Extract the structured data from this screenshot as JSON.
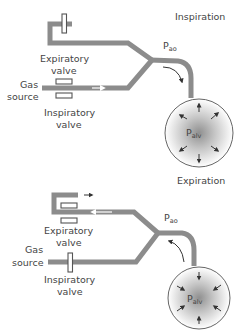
{
  "diagram": {
    "type": "ventilator-circuit-schematic",
    "colors": {
      "tube": "#8c8c8c",
      "valve_outline": "#555555",
      "alveolus_outline": "#666666",
      "alveolus_fill_center": "#9a9a9a",
      "arrow": "#333333",
      "text": "#444444"
    },
    "panels": [
      {
        "id": "inspiration",
        "title": "Inspiration",
        "labels": {
          "expiratory_valve_line1": "Expiratory",
          "expiratory_valve_line2": "valve",
          "gas_source_line1": "Gas",
          "gas_source_line2": "source",
          "inspiratory_valve_line1": "Inspiratory",
          "inspiratory_valve_line2": "valve",
          "airway_pressure_main": "P",
          "airway_pressure_sub": "ao",
          "alveolar_pressure_main": "P",
          "alveolar_pressure_sub": "alv"
        },
        "state": {
          "expiratory_valve": "closed",
          "inspiratory_valve": "open",
          "flow_direction": "into alveolus",
          "alveolar_arrows": "outward"
        }
      },
      {
        "id": "expiration",
        "title": "Expiration",
        "labels": {
          "expiratory_valve_line1": "Expiratory",
          "expiratory_valve_line2": "valve",
          "gas_source_line1": "Gas",
          "gas_source_line2": "source",
          "inspiratory_valve_line1": "Inspiratory",
          "inspiratory_valve_line2": "valve",
          "airway_pressure_main": "P",
          "airway_pressure_sub": "ao",
          "alveolar_pressure_main": "P",
          "alveolar_pressure_sub": "alv"
        },
        "state": {
          "expiratory_valve": "open",
          "inspiratory_valve": "closed",
          "flow_direction": "out of alveolus",
          "alveolar_arrows": "inward"
        }
      }
    ]
  }
}
